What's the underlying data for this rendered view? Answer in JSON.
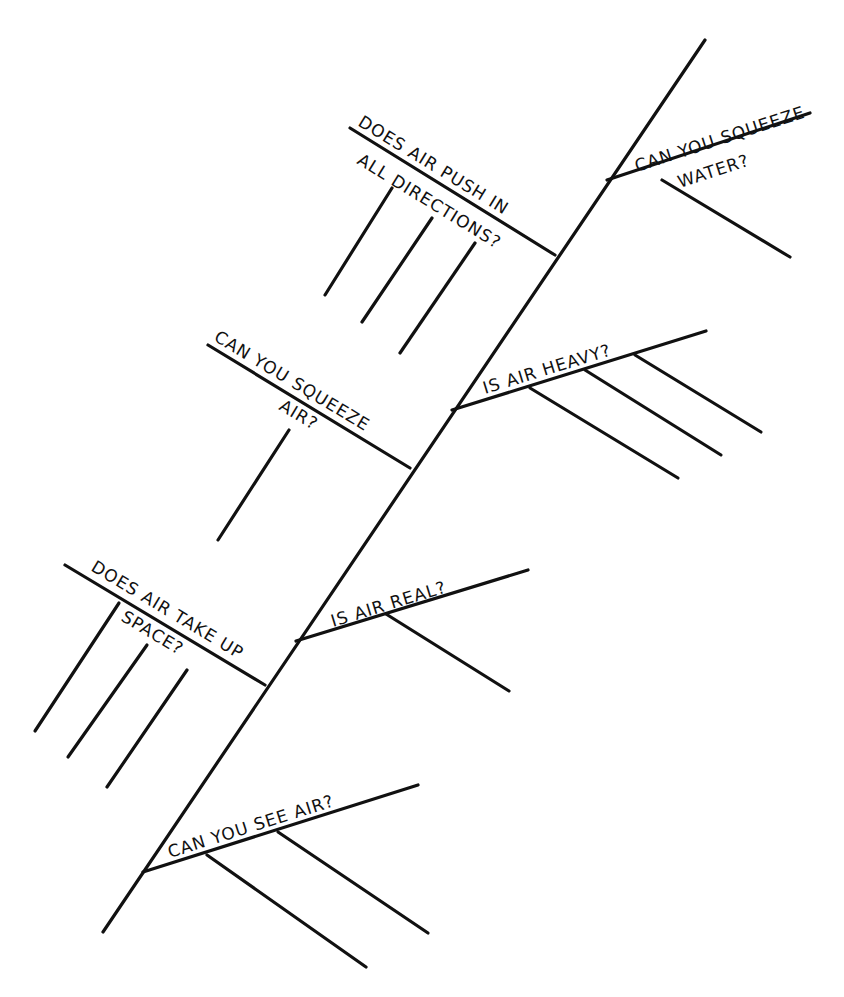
{
  "diagram": {
    "type": "fishbone",
    "stroke_color": "#111111",
    "background": "#ffffff",
    "branches": [
      {
        "id": "squeeze-water",
        "lines": [
          "CAN YOU SQUEEZE",
          "WATER?"
        ],
        "sub_lines": 1
      },
      {
        "id": "push-directions",
        "lines": [
          "DOES AIR PUSH IN",
          "ALL DIRECTIONS?"
        ],
        "sub_lines": 3
      },
      {
        "id": "air-heavy",
        "lines": [
          "IS AIR HEAVY?"
        ],
        "sub_lines": 3
      },
      {
        "id": "squeeze-air",
        "lines": [
          "CAN YOU SQUEEZE",
          "AIR?"
        ],
        "sub_lines": 1
      },
      {
        "id": "take-up-space",
        "lines": [
          "DOES AIR TAKE UP",
          "SPACE?"
        ],
        "sub_lines": 3
      },
      {
        "id": "air-real",
        "lines": [
          "IS AIR REAL?"
        ],
        "sub_lines": 1
      },
      {
        "id": "see-air",
        "lines": [
          "CAN YOU SEE AIR?"
        ],
        "sub_lines": 2
      }
    ]
  }
}
